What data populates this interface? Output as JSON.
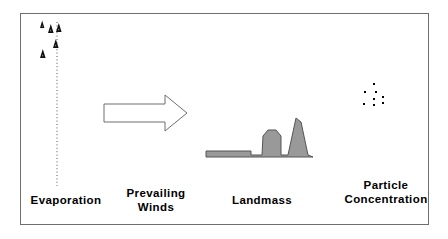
{
  "diagram": {
    "frame": {
      "x": 20,
      "y": 13,
      "width": 409,
      "height": 212,
      "border_color": "#6e6e6e",
      "background": "#ffffff"
    },
    "labels": {
      "evaporation": "Evaporation",
      "prevailing_winds": "Prevailing\nWinds",
      "landmass": "Landmass",
      "particle_concentration": "Particle\nConcentration"
    },
    "colors": {
      "ink": "#000000",
      "outline": "#6e6e6e",
      "landmass_fill": "#999999",
      "landmass_stroke": "#555555",
      "dotted_line": "#555555"
    },
    "evaporation": {
      "dotted_line": {
        "x": 57,
        "y_top": 22,
        "y_bottom": 186,
        "style": "dotted"
      },
      "particle_markers": [
        {
          "x": 40,
          "y": 24,
          "size": 4
        },
        {
          "x": 49,
          "y": 28,
          "size": 5
        },
        {
          "x": 58,
          "y": 27,
          "size": 5
        },
        {
          "x": 55,
          "y": 43,
          "size": 5
        },
        {
          "x": 42,
          "y": 53,
          "size": 5
        }
      ],
      "marker_glyph": "caret-particle"
    },
    "wind_arrow": {
      "direction": "right",
      "fill": "none",
      "stroke": "#6e6e6e",
      "tail_x": 104,
      "tail_y_top": 104,
      "tail_y_bottom": 122,
      "neck_x": 165,
      "head_y_top": 95,
      "head_y_bottom": 131,
      "tip_x": 187,
      "tip_y": 113
    },
    "landmass": {
      "fill": "#999999",
      "stroke": "#555555",
      "baseline_y": 157,
      "outline_points": "206,157 206,151 251,151 251,155 262,155 263,136 268,130 276,130 281,136 281,155 288,155 296,118 301,122 308,155 313,157",
      "peaks": [
        {
          "name": "plateau-hill",
          "apex_x": 272,
          "apex_y": 130,
          "height_px": 27
        },
        {
          "name": "tall-peak",
          "apex_x": 297,
          "apex_y": 118,
          "height_px": 39
        }
      ],
      "flat_shelf": {
        "x_start": 206,
        "x_end": 251,
        "top_y": 151
      }
    },
    "particle_concentration": {
      "dot_color": "#000000",
      "dot_size": 2,
      "dots": [
        {
          "x": 374,
          "y": 84
        },
        {
          "x": 365,
          "y": 92
        },
        {
          "x": 376,
          "y": 92
        },
        {
          "x": 374,
          "y": 99
        },
        {
          "x": 383,
          "y": 97
        },
        {
          "x": 364,
          "y": 104
        },
        {
          "x": 374,
          "y": 105
        },
        {
          "x": 383,
          "y": 103
        }
      ]
    }
  }
}
